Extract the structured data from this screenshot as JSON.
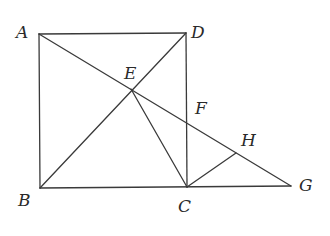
{
  "diagram": {
    "type": "geometry",
    "points": {
      "A": {
        "label": "A",
        "x": 39,
        "y": 34,
        "lx": 16,
        "ly": 38
      },
      "D": {
        "label": "D",
        "x": 186,
        "y": 33,
        "lx": 191,
        "ly": 38
      },
      "B": {
        "label": "B",
        "x": 40,
        "y": 188,
        "lx": 18,
        "ly": 206
      },
      "C": {
        "label": "C",
        "x": 187,
        "y": 187,
        "lx": 178,
        "ly": 212
      },
      "E": {
        "label": "E",
        "x": 131,
        "y": 89,
        "lx": 124,
        "ly": 79
      },
      "F": {
        "label": "F",
        "x": 186,
        "y": 123,
        "lx": 195,
        "ly": 114
      },
      "H": {
        "label": "H",
        "x": 236,
        "y": 153,
        "lx": 241,
        "ly": 146
      },
      "G": {
        "label": "G",
        "x": 291,
        "y": 186,
        "lx": 299,
        "ly": 191
      }
    },
    "segments": [
      [
        "A",
        "D"
      ],
      [
        "A",
        "B"
      ],
      [
        "D",
        "C"
      ],
      [
        "B",
        "G"
      ],
      [
        "A",
        "G"
      ],
      [
        "B",
        "D"
      ],
      [
        "E",
        "C"
      ],
      [
        "C",
        "H"
      ]
    ],
    "stroke_color": "#3a3a3a",
    "background": "#ffffff"
  }
}
